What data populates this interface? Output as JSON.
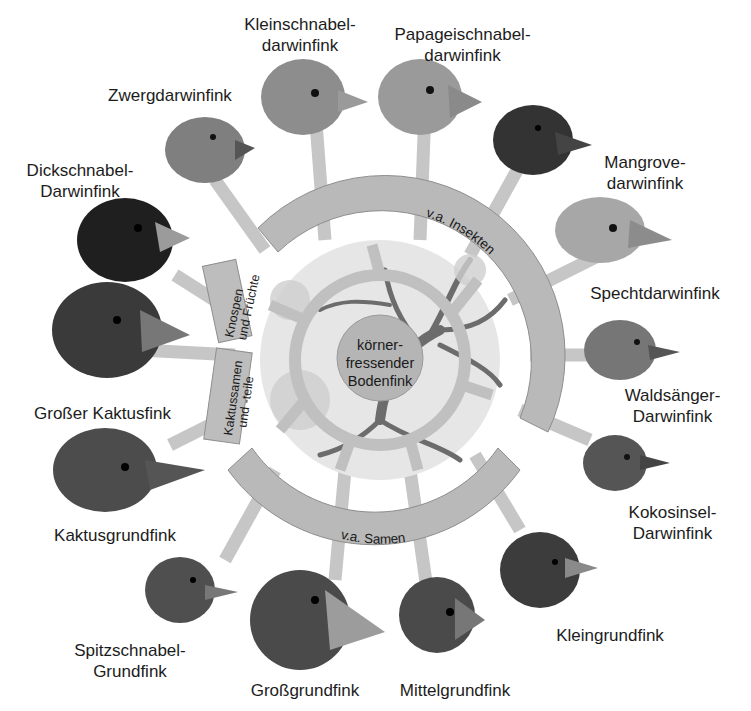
{
  "diagram": {
    "center": {
      "label": "körner-\nfressender\nBodenfink"
    },
    "food_groups": [
      {
        "id": "insekten",
        "label": "v.a. Insekten"
      },
      {
        "id": "knospen",
        "label": "Knospen\nund Früchte"
      },
      {
        "id": "kaktus",
        "label": "Kaktussamen\nund -teile"
      },
      {
        "id": "samen",
        "label": "v.a. Samen"
      }
    ],
    "species": [
      {
        "id": "kleinschnabel",
        "label": "Kleinschnabel-\ndarwinfink",
        "group": "insekten"
      },
      {
        "id": "papageischnabel",
        "label": "Papageischnabel-\ndarwinfink",
        "group": "insekten"
      },
      {
        "id": "mangrove",
        "label": "Mangrove-\ndarwinfink",
        "group": "insekten"
      },
      {
        "id": "specht",
        "label": "Spechtdarwinfink",
        "group": "insekten"
      },
      {
        "id": "waldsaenger",
        "label": "Waldsänger-\nDarwinfink",
        "group": "insekten"
      },
      {
        "id": "kokosinsel",
        "label": "Kokosinsel-\nDarwinfink",
        "group": "insekten"
      },
      {
        "id": "zwerg",
        "label": "Zwergdarwinfink",
        "group": "insekten"
      },
      {
        "id": "dickschnabel",
        "label": "Dickschnabel-\nDarwinfink",
        "group": "knospen"
      },
      {
        "id": "grosser_kaktus",
        "label": "Großer Kaktusfink",
        "group": "kaktus"
      },
      {
        "id": "kaktusgrund",
        "label": "Kaktusgrundfink",
        "group": "kaktus"
      },
      {
        "id": "spitzschnabel",
        "label": "Spitzschnabel-\nGrundfink",
        "group": "samen"
      },
      {
        "id": "grossgrund",
        "label": "Großgrundfink",
        "group": "samen"
      },
      {
        "id": "mittelgrund",
        "label": "Mittelgrundfink",
        "group": "samen"
      },
      {
        "id": "kleingrund",
        "label": "Kleingrundfink",
        "group": "samen"
      }
    ]
  },
  "colors": {
    "ring": "#b9b9b9",
    "ring_stroke": "#8e8e8e",
    "inner_fill": "#e4e4e4",
    "branch": "#c4c4c4",
    "tree": "#6a6a6a",
    "text": "#1c1c1c"
  }
}
